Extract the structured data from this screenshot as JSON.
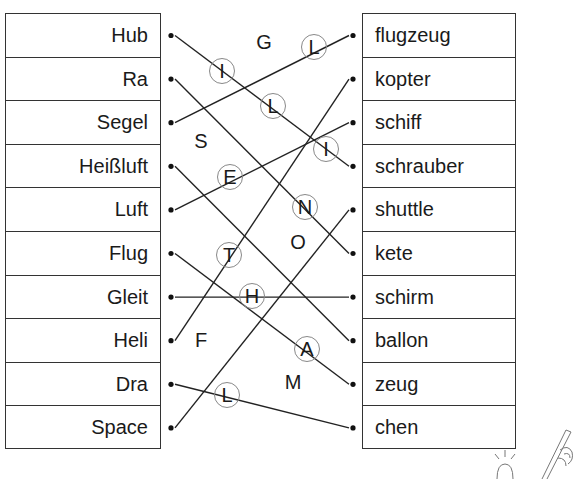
{
  "worksheet": {
    "left_words": [
      "Hub",
      "Ra",
      "Segel",
      "Heißluft",
      "Luft",
      "Flug",
      "Gleit",
      "Heli",
      "Dra",
      "Space"
    ],
    "right_words": [
      "flugzeug",
      "kopter",
      "schiff",
      "schrauber",
      "shuttle",
      "kete",
      "schirm",
      "ballon",
      "zeug",
      "chen"
    ],
    "connections": [
      {
        "left": "Hub",
        "right": "schrauber"
      },
      {
        "left": "Ra",
        "right": "kete"
      },
      {
        "left": "Segel",
        "right": "flugzeug"
      },
      {
        "left": "Heißluft",
        "right": "ballon"
      },
      {
        "left": "Luft",
        "right": "schiff"
      },
      {
        "left": "Flug",
        "right": "zeug"
      },
      {
        "left": "Gleit",
        "right": "schirm"
      },
      {
        "left": "Heli",
        "right": "kopter"
      },
      {
        "left": "Dra",
        "right": "chen"
      },
      {
        "left": "Space",
        "right": "shuttle"
      }
    ],
    "circled_letters": [
      {
        "char": "I",
        "x": 222,
        "y": 71
      },
      {
        "char": "L",
        "x": 314,
        "y": 47
      },
      {
        "char": "L",
        "x": 273,
        "y": 106
      },
      {
        "char": "I",
        "x": 326,
        "y": 149
      },
      {
        "char": "E",
        "x": 230,
        "y": 177
      },
      {
        "char": "N",
        "x": 305,
        "y": 207
      },
      {
        "char": "T",
        "x": 229,
        "y": 255
      },
      {
        "char": "H",
        "x": 252,
        "y": 296
      },
      {
        "char": "A",
        "x": 307,
        "y": 349
      },
      {
        "char": "L",
        "x": 227,
        "y": 395
      }
    ],
    "free_letters": [
      {
        "char": "G",
        "x": 264,
        "y": 42
      },
      {
        "char": "S",
        "x": 201,
        "y": 141
      },
      {
        "char": "O",
        "x": 298,
        "y": 242
      },
      {
        "char": "F",
        "x": 201,
        "y": 340
      },
      {
        "char": "M",
        "x": 293,
        "y": 382
      }
    ],
    "decorations": [
      "lightbulb-icon",
      "pencil-hand-icon"
    ]
  }
}
